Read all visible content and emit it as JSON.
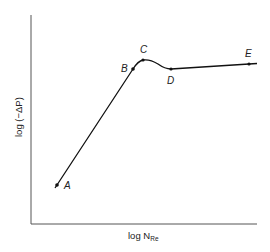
{
  "diagram": {
    "x_axis_label": "log N",
    "x_axis_subscript": "Re",
    "y_axis_label": "log (−ΔP)",
    "axis_color": "#555555",
    "curve_color": "#111111"
  },
  "points": [
    {
      "id": "A",
      "label": "A"
    },
    {
      "id": "B",
      "label": "B"
    },
    {
      "id": "C",
      "label": "C"
    },
    {
      "id": "D",
      "label": "D"
    },
    {
      "id": "E",
      "label": "E"
    }
  ]
}
